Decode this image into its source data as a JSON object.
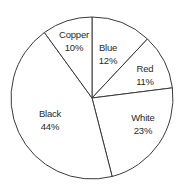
{
  "chart_data": {
    "type": "pie",
    "title": "",
    "categories": [
      "Copper",
      "Blue",
      "Red",
      "White",
      "Black"
    ],
    "values": [
      10,
      12,
      11,
      23,
      44
    ],
    "unit": "%",
    "start_angle_deg": -90,
    "direction": "clockwise",
    "legend": "none (labels inside slices)",
    "slices": [
      {
        "label": "Blue",
        "value": 12,
        "value_text": "12%"
      },
      {
        "label": "Red",
        "value": 11,
        "value_text": "11%"
      },
      {
        "label": "White",
        "value": 23,
        "value_text": "23%"
      },
      {
        "label": "Black",
        "value": 44,
        "value_text": "44%"
      },
      {
        "label": "Copper",
        "value": 10,
        "value_text": "10%"
      }
    ]
  },
  "style": {
    "fill": "#ffffff",
    "stroke": "#3a3a3a",
    "text_color": "#2a2a2a"
  }
}
